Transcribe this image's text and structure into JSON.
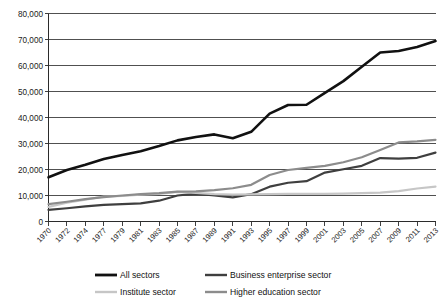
{
  "chart_data": {
    "type": "line",
    "title": "",
    "subtitle": "",
    "xlabel": "",
    "ylabel": "",
    "ylim": [
      0,
      80000
    ],
    "ytick_labels": [
      "80,000",
      "70,000",
      "60,000",
      "50,000",
      "40,000",
      "30,000",
      "20,000",
      "10,000",
      "0"
    ],
    "ytick_values": [
      80000,
      70000,
      60000,
      50000,
      40000,
      30000,
      20000,
      10000,
      0
    ],
    "grid": true,
    "legend_position": "bottom",
    "categories": [
      "1970",
      "1972",
      "1974",
      "1977",
      "1979",
      "1981",
      "1983",
      "1985",
      "1987",
      "1989",
      "1991",
      "1993",
      "1995",
      "1997",
      "1999",
      "2001",
      "2003",
      "2005",
      "2007",
      "2009",
      "2011",
      "2013"
    ],
    "series": [
      {
        "name": "All sectors",
        "color": "#111111",
        "width": 2.6,
        "values": [
          17000,
          19800,
          21800,
          24000,
          25600,
          27000,
          29000,
          31200,
          32500,
          33500,
          32000,
          34500,
          41500,
          44800,
          44900,
          49500,
          54000,
          59500,
          65000,
          65600,
          67100,
          69400
        ]
      },
      {
        "name": "Business enterprise sector",
        "color": "#3f3f3f",
        "width": 2.2,
        "values": [
          4500,
          5100,
          5800,
          6400,
          6700,
          7000,
          8000,
          10000,
          10700,
          10000,
          9300,
          10500,
          13400,
          14900,
          15500,
          18800,
          20100,
          21400,
          24400,
          24200,
          24500,
          26500
        ]
      },
      {
        "name": "Institute sector",
        "color": "#c6c6c6",
        "width": 2.2,
        "values": [
          5600,
          7200,
          8400,
          9600,
          9800,
          10300,
          10600,
          11400,
          11000,
          10500,
          10300,
          10400,
          10500,
          10600,
          10600,
          10600,
          10700,
          10900,
          11100,
          11700,
          12700,
          13400
        ]
      },
      {
        "name": "Higher education sector",
        "color": "#8c8c8c",
        "width": 2.2,
        "values": [
          6700,
          7600,
          8600,
          9400,
          10000,
          10500,
          10900,
          11500,
          11600,
          12100,
          12800,
          14100,
          17900,
          19800,
          20600,
          21400,
          22800,
          24700,
          27500,
          30400,
          30800,
          31400
        ]
      }
    ],
    "legend": [
      {
        "label": "All sectors",
        "color": "#111111",
        "width": 2.8
      },
      {
        "label": "Business enterprise sector",
        "color": "#3f3f3f",
        "width": 2.4
      },
      {
        "label": "Institute sector",
        "color": "#c6c6c6",
        "width": 2.4
      },
      {
        "label": "Higher education sector",
        "color": "#8c8c8c",
        "width": 2.4
      }
    ]
  }
}
